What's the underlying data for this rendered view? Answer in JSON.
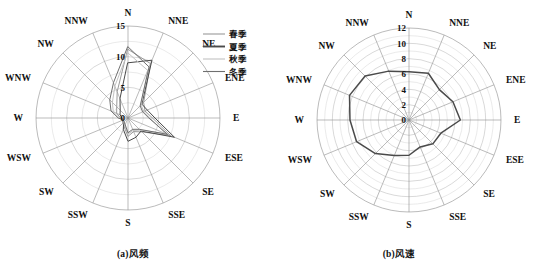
{
  "figure": {
    "directions": [
      "N",
      "NNE",
      "NE",
      "ENE",
      "E",
      "ESE",
      "SE",
      "SSE",
      "S",
      "SSW",
      "SW",
      "WSW",
      "W",
      "WNW",
      "NW",
      "NNW"
    ]
  },
  "panel_a": {
    "caption": "(a)风频",
    "legend": {
      "items": [
        {
          "label": "春季",
          "color": "#9a9a9a"
        },
        {
          "label": "夏季",
          "color": "#4a4a4a"
        },
        {
          "label": "秋季",
          "color": "#c2c2c2"
        },
        {
          "label": "冬季",
          "color": "#6f6f6f"
        }
      ]
    }
  },
  "panel_b": {
    "caption": "(b)风速"
  },
  "chart_data": [
    {
      "type": "line",
      "subtype": "radar",
      "title": "(a)风频",
      "xlabel": "",
      "ylabel": "",
      "grid": true,
      "legend_position": "top-right",
      "categories": [
        "N",
        "NNE",
        "NE",
        "ENE",
        "E",
        "ESE",
        "SE",
        "SSE",
        "S",
        "SSW",
        "SW",
        "WSW",
        "W",
        "WNW",
        "NW",
        "NNW"
      ],
      "rlim": [
        0,
        15
      ],
      "rticks": [
        0,
        5,
        10,
        15
      ],
      "rtick_labels": [
        "0",
        "5",
        "10",
        "15"
      ],
      "series": [
        {
          "name": "春季",
          "color": "#9a9a9a",
          "values": [
            11.2,
            9.6,
            3.6,
            3.0,
            4.0,
            7.5,
            3.2,
            2.4,
            3.0,
            1.6,
            1.2,
            1.0,
            1.2,
            2.0,
            2.6,
            4.6
          ]
        },
        {
          "name": "夏季",
          "color": "#4a4a4a",
          "values": [
            9.0,
            10.2,
            3.2,
            3.4,
            4.4,
            8.2,
            3.0,
            3.4,
            3.8,
            2.0,
            1.0,
            0.9,
            1.0,
            1.4,
            1.8,
            3.4
          ]
        },
        {
          "name": "秋季",
          "color": "#c2c2c2",
          "values": [
            10.6,
            8.4,
            3.0,
            2.8,
            3.6,
            6.6,
            2.8,
            2.2,
            2.6,
            1.4,
            1.0,
            0.8,
            1.4,
            2.6,
            3.6,
            5.6
          ]
        },
        {
          "name": "冬季",
          "color": "#6f6f6f",
          "values": [
            11.6,
            9.0,
            2.8,
            2.6,
            3.4,
            7.0,
            2.6,
            2.0,
            2.4,
            1.2,
            0.9,
            0.8,
            1.6,
            3.0,
            4.2,
            6.2
          ]
        }
      ]
    },
    {
      "type": "line",
      "subtype": "radar",
      "title": "(b)风速",
      "xlabel": "",
      "ylabel": "",
      "grid": true,
      "legend_position": "none",
      "categories": [
        "N",
        "NNE",
        "NE",
        "ENE",
        "E",
        "ESE",
        "SE",
        "SSE",
        "S",
        "SSW",
        "SW",
        "WSW",
        "W",
        "WNW",
        "NW",
        "NNW"
      ],
      "rlim": [
        0,
        12
      ],
      "rticks": [
        0,
        2,
        4,
        6,
        8,
        10,
        12
      ],
      "rtick_labels": [
        "0",
        "2",
        "4",
        "6",
        "8",
        "10",
        "12"
      ],
      "series": [
        {
          "name": "风速",
          "color": "#4a4a4a",
          "values": [
            6.3,
            6.6,
            5.6,
            6.2,
            6.7,
            4.5,
            4.4,
            3.8,
            4.6,
            5.0,
            6.2,
            7.4,
            7.7,
            8.4,
            8.1,
            6.9
          ]
        }
      ]
    }
  ]
}
